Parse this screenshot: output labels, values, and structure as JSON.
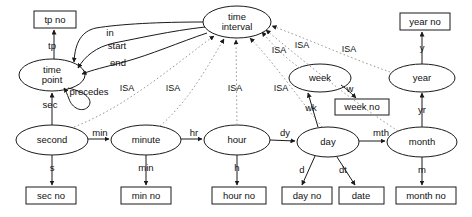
{
  "diagram": {
    "type": "entity-relationship-diagram",
    "colors": {
      "stroke": "#1a1a1a",
      "isa_stroke": "#999999",
      "background": "#ffffff",
      "text": "#111111"
    },
    "entities": [
      {
        "id": "time_interval",
        "label": "time interval",
        "label_line1": "time",
        "label_line2": "interval",
        "cx": 237,
        "cy": 22,
        "rx": 34,
        "ry": 16
      },
      {
        "id": "time_point",
        "label": "time point",
        "label_line1": "time",
        "label_line2": "point",
        "cx": 52,
        "cy": 75,
        "rx": 33,
        "ry": 16
      },
      {
        "id": "second",
        "label": "second",
        "cx": 52,
        "cy": 140,
        "rx": 36,
        "ry": 15
      },
      {
        "id": "minute",
        "label": "minute",
        "cx": 146,
        "cy": 140,
        "rx": 35,
        "ry": 15
      },
      {
        "id": "hour",
        "label": "hour",
        "cx": 237,
        "cy": 140,
        "rx": 33,
        "ry": 15
      },
      {
        "id": "day",
        "label": "day",
        "cx": 328,
        "cy": 142,
        "rx": 31,
        "ry": 15
      },
      {
        "id": "week",
        "label": "week",
        "cx": 320,
        "cy": 78,
        "rx": 31,
        "ry": 14
      },
      {
        "id": "month",
        "label": "month",
        "cx": 422,
        "cy": 142,
        "rx": 35,
        "ry": 15
      },
      {
        "id": "year",
        "label": "year",
        "cx": 422,
        "cy": 78,
        "rx": 33,
        "ry": 14
      }
    ],
    "attributes": [
      {
        "id": "tp_no",
        "label": "tp no",
        "x": 34,
        "y": 11,
        "w": 42,
        "h": 17
      },
      {
        "id": "sec_no",
        "label": "sec no",
        "x": 26,
        "y": 187,
        "w": 50,
        "h": 17
      },
      {
        "id": "min_no",
        "label": "min no",
        "x": 121,
        "y": 187,
        "w": 50,
        "h": 17
      },
      {
        "id": "hour_no",
        "label": "hour no",
        "x": 212,
        "y": 187,
        "w": 54,
        "h": 17
      },
      {
        "id": "day_no",
        "label": "day no",
        "x": 282,
        "y": 187,
        "w": 50,
        "h": 17
      },
      {
        "id": "date",
        "label": "date",
        "x": 339,
        "y": 187,
        "w": 45,
        "h": 17
      },
      {
        "id": "week_no",
        "label": "week no",
        "x": 335,
        "y": 99,
        "w": 54,
        "h": 16
      },
      {
        "id": "month_no",
        "label": "month no",
        "x": 396,
        "y": 187,
        "w": 60,
        "h": 17
      },
      {
        "id": "year_no",
        "label": "year no",
        "x": 400,
        "y": 13,
        "w": 50,
        "h": 17
      }
    ],
    "edge_labels": [
      {
        "id": "tp",
        "label": "tp",
        "x": 52,
        "y": 46
      },
      {
        "id": "in",
        "label": "in",
        "x": 110,
        "y": 33
      },
      {
        "id": "start",
        "label": "start",
        "x": 117,
        "y": 46
      },
      {
        "id": "end",
        "label": "end",
        "x": 118,
        "y": 63
      },
      {
        "id": "precedes",
        "label": "precedes",
        "x": 89,
        "y": 92
      },
      {
        "id": "sec",
        "label": "sec",
        "x": 50,
        "y": 105
      },
      {
        "id": "s",
        "label": "s",
        "x": 52,
        "y": 168
      },
      {
        "id": "min_rel",
        "label": "min",
        "x": 100,
        "y": 133
      },
      {
        "id": "min_attr",
        "label": "min",
        "x": 146,
        "y": 168
      },
      {
        "id": "hr",
        "label": "hr",
        "x": 194,
        "y": 133
      },
      {
        "id": "h",
        "label": "h",
        "x": 237,
        "y": 168
      },
      {
        "id": "dy",
        "label": "dy",
        "x": 285,
        "y": 133
      },
      {
        "id": "d",
        "label": "d",
        "x": 302,
        "y": 170
      },
      {
        "id": "dt",
        "label": "dt",
        "x": 343,
        "y": 170
      },
      {
        "id": "wk",
        "label": "wk",
        "x": 311,
        "y": 108
      },
      {
        "id": "w",
        "label": "w",
        "x": 350,
        "y": 89
      },
      {
        "id": "mth",
        "label": "mth",
        "x": 381,
        "y": 133
      },
      {
        "id": "m",
        "label": "m",
        "x": 422,
        "y": 170
      },
      {
        "id": "yr",
        "label": "yr",
        "x": 422,
        "y": 110
      },
      {
        "id": "y",
        "label": "y",
        "x": 422,
        "y": 48
      }
    ],
    "isa_labels": [
      {
        "id": "isa1",
        "label": "ISA",
        "x": 127,
        "y": 89
      },
      {
        "id": "isa2",
        "label": "ISA",
        "x": 173,
        "y": 89
      },
      {
        "id": "isa3",
        "label": "ISA",
        "x": 235,
        "y": 89
      },
      {
        "id": "isa4",
        "label": "ISA",
        "x": 281,
        "y": 89
      },
      {
        "id": "isa5",
        "label": "ISA",
        "x": 279,
        "y": 51
      },
      {
        "id": "isa6",
        "label": "ISA",
        "x": 302,
        "y": 46
      },
      {
        "id": "isa7",
        "label": "ISA",
        "x": 349,
        "y": 50
      }
    ],
    "relationships": [
      {
        "from": "time_point",
        "to": "tp_no",
        "label": "tp",
        "kind": "attribute"
      },
      {
        "from": "time_point",
        "to": "time_interval",
        "label": "in",
        "kind": "relation"
      },
      {
        "from": "time_point",
        "to": "time_interval",
        "label": "start",
        "kind": "relation"
      },
      {
        "from": "time_point",
        "to": "time_interval",
        "label": "end",
        "kind": "relation"
      },
      {
        "from": "time_point",
        "to": "time_point",
        "label": "precedes",
        "kind": "self-relation"
      },
      {
        "from": "second",
        "to": "time_point",
        "label": "sec",
        "kind": "relation"
      },
      {
        "from": "second",
        "to": "sec_no",
        "label": "s",
        "kind": "attribute"
      },
      {
        "from": "second",
        "to": "minute",
        "label": "min",
        "kind": "relation"
      },
      {
        "from": "minute",
        "to": "min_no",
        "label": "min",
        "kind": "attribute"
      },
      {
        "from": "minute",
        "to": "hour",
        "label": "hr",
        "kind": "relation"
      },
      {
        "from": "hour",
        "to": "hour_no",
        "label": "h",
        "kind": "attribute"
      },
      {
        "from": "hour",
        "to": "day",
        "label": "dy",
        "kind": "relation"
      },
      {
        "from": "day",
        "to": "day_no",
        "label": "d",
        "kind": "attribute"
      },
      {
        "from": "day",
        "to": "date",
        "label": "dt",
        "kind": "attribute"
      },
      {
        "from": "day",
        "to": "week",
        "label": "wk",
        "kind": "relation"
      },
      {
        "from": "week",
        "to": "week_no",
        "label": "w",
        "kind": "attribute"
      },
      {
        "from": "day",
        "to": "month",
        "label": "mth",
        "kind": "relation"
      },
      {
        "from": "month",
        "to": "month_no",
        "label": "m",
        "kind": "attribute"
      },
      {
        "from": "month",
        "to": "year",
        "label": "yr",
        "kind": "relation"
      },
      {
        "from": "year",
        "to": "year_no",
        "label": "y",
        "kind": "attribute"
      },
      {
        "from": "minute",
        "to": "time_interval",
        "label": "ISA",
        "kind": "isa"
      },
      {
        "from": "hour",
        "to": "time_interval",
        "label": "ISA",
        "kind": "isa"
      },
      {
        "from": "day",
        "to": "time_interval",
        "label": "ISA",
        "kind": "isa"
      },
      {
        "from": "week",
        "to": "time_interval",
        "label": "ISA",
        "kind": "isa"
      },
      {
        "from": "month",
        "to": "time_interval",
        "label": "ISA",
        "kind": "isa"
      },
      {
        "from": "year",
        "to": "time_interval",
        "label": "ISA",
        "kind": "isa"
      },
      {
        "from": "second",
        "to": "time_interval",
        "label": "ISA",
        "kind": "isa"
      }
    ]
  }
}
